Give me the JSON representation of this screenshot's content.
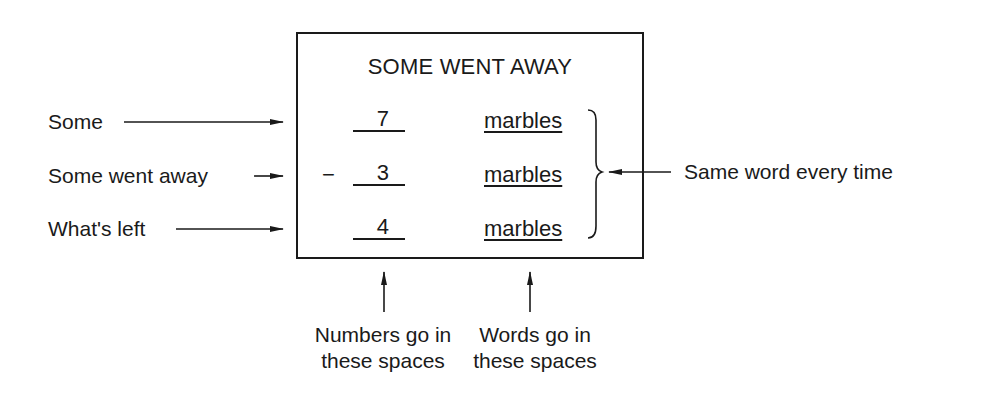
{
  "diagram": {
    "title": "SOME WENT AWAY",
    "left_labels": [
      {
        "text": "Some"
      },
      {
        "text": "Some went away"
      },
      {
        "text": "What's left"
      }
    ],
    "rows": [
      {
        "operator": "",
        "number": "7",
        "word": "marbles"
      },
      {
        "operator": "−",
        "number": "3",
        "word": "marbles"
      },
      {
        "operator": "",
        "number": "4",
        "word": "marbles"
      }
    ],
    "right_label": "Same word every time",
    "bottom_labels": {
      "numbers": {
        "line1": "Numbers go in",
        "line2": "these spaces"
      },
      "words": {
        "line1": "Words go in",
        "line2": "these spaces"
      }
    }
  }
}
